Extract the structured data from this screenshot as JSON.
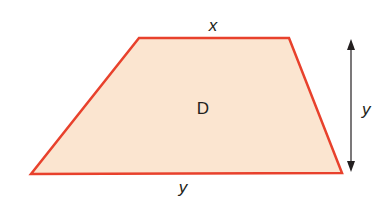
{
  "diagram": {
    "shape": "trapezium",
    "region_label": "D",
    "top_side_label": "x",
    "bottom_side_label": "y",
    "height_label": "y",
    "colors": {
      "fill": "#fbe5d0",
      "outline": "#e8412c",
      "arrow": "#231f20",
      "text": "#231f20"
    }
  }
}
